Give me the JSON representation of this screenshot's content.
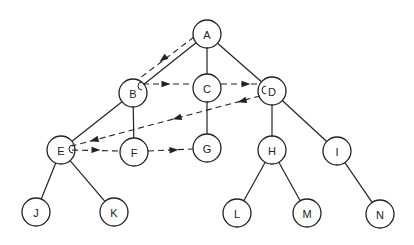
{
  "diagram": {
    "type": "tree-traversal",
    "colors": {
      "stroke": "#222222",
      "fill": "#ffffff",
      "text": "#222222"
    },
    "node_radius": 14,
    "nodes": [
      {
        "id": "A",
        "label": "A",
        "x": 207,
        "y": 34
      },
      {
        "id": "B",
        "label": "B",
        "x": 133,
        "y": 93
      },
      {
        "id": "C",
        "label": "C",
        "x": 207,
        "y": 88
      },
      {
        "id": "D",
        "label": "D",
        "x": 272,
        "y": 91
      },
      {
        "id": "E",
        "label": "E",
        "x": 61,
        "y": 150
      },
      {
        "id": "F",
        "label": "F",
        "x": 134,
        "y": 152
      },
      {
        "id": "G",
        "label": "G",
        "x": 207,
        "y": 148
      },
      {
        "id": "H",
        "label": "H",
        "x": 272,
        "y": 150
      },
      {
        "id": "I",
        "label": "I",
        "x": 337,
        "y": 151
      },
      {
        "id": "J",
        "label": "J",
        "x": 36,
        "y": 212
      },
      {
        "id": "K",
        "label": "K",
        "x": 114,
        "y": 212
      },
      {
        "id": "L",
        "label": "L",
        "x": 237,
        "y": 213
      },
      {
        "id": "M",
        "label": "M",
        "x": 307,
        "y": 213
      },
      {
        "id": "N",
        "label": "N",
        "x": 380,
        "y": 214
      }
    ],
    "edges": [
      {
        "from": "A",
        "to": "B"
      },
      {
        "from": "A",
        "to": "C"
      },
      {
        "from": "A",
        "to": "D"
      },
      {
        "from": "B",
        "to": "E"
      },
      {
        "from": "B",
        "to": "F"
      },
      {
        "from": "C",
        "to": "G"
      },
      {
        "from": "D",
        "to": "H"
      },
      {
        "from": "D",
        "to": "I"
      },
      {
        "from": "E",
        "to": "J"
      },
      {
        "from": "E",
        "to": "K"
      },
      {
        "from": "H",
        "to": "L"
      },
      {
        "from": "H",
        "to": "M"
      },
      {
        "from": "I",
        "to": "N"
      }
    ],
    "traversal_path": [
      {
        "from": "A",
        "to": "B",
        "points": [
          [
            194,
            37
          ],
          [
            140,
            78
          ]
        ],
        "arrows": [
          [
            163,
            59
          ]
        ]
      },
      {
        "from": "B",
        "to": "C",
        "points": [
          [
            143,
            84
          ],
          [
            193,
            84
          ]
        ],
        "arrows": [
          [
            166,
            84
          ]
        ]
      },
      {
        "from": "C",
        "to": "D",
        "points": [
          [
            221,
            84
          ],
          [
            259,
            84
          ]
        ],
        "arrows": [
          [
            246,
            84
          ]
        ]
      },
      {
        "from": "D",
        "to": "E",
        "points": [
          [
            260,
            96
          ],
          [
            72,
            146
          ]
        ],
        "arrows": [
          [
            242,
            101
          ],
          [
            177,
            118
          ],
          [
            94,
            140
          ]
        ]
      },
      {
        "from": "E",
        "to": "F",
        "points": [
          [
            72,
            150
          ],
          [
            120,
            151
          ]
        ],
        "arrows": [
          [
            96,
            150
          ]
        ]
      },
      {
        "from": "F",
        "to": "G",
        "points": [
          [
            148,
            151
          ],
          [
            193,
            149
          ]
        ],
        "arrows": [
          [
            174,
            150
          ]
        ]
      }
    ],
    "turn_marks": [
      {
        "node": "B",
        "x": 139,
        "y": 86
      },
      {
        "node": "D",
        "x": 263,
        "y": 90
      },
      {
        "node": "E",
        "x": 70,
        "y": 149
      }
    ]
  }
}
